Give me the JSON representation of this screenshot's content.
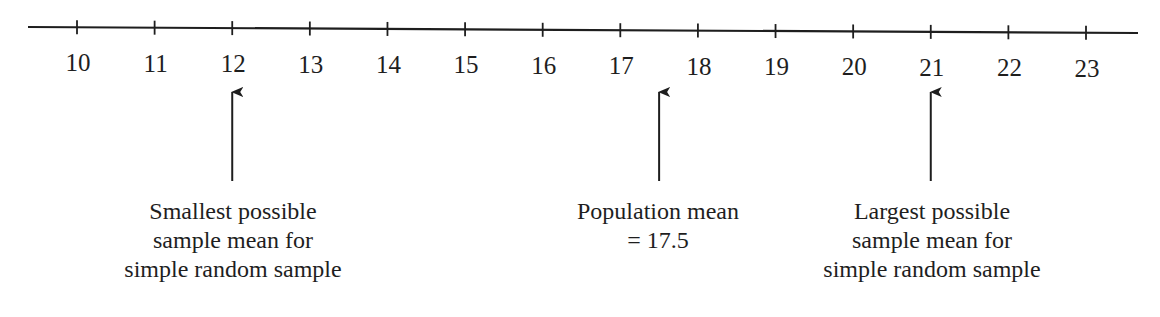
{
  "number_line": {
    "min": 10,
    "max": 23,
    "ticks": [
      "10",
      "11",
      "12",
      "13",
      "14",
      "15",
      "16",
      "17",
      "18",
      "19",
      "20",
      "21",
      "22",
      "23"
    ]
  },
  "annotations": [
    {
      "id": "smallest",
      "value": 12,
      "lines": [
        "Smallest possible",
        "sample mean for",
        "simple random sample"
      ]
    },
    {
      "id": "population-mean",
      "value": 17.5,
      "lines": [
        "Population mean",
        "= 17.5"
      ]
    },
    {
      "id": "largest",
      "value": 21,
      "lines": [
        "Largest possible",
        "sample mean for",
        "simple random sample"
      ]
    }
  ],
  "colors": {
    "ink": "#1e1e1e",
    "background": "#ffffff"
  }
}
